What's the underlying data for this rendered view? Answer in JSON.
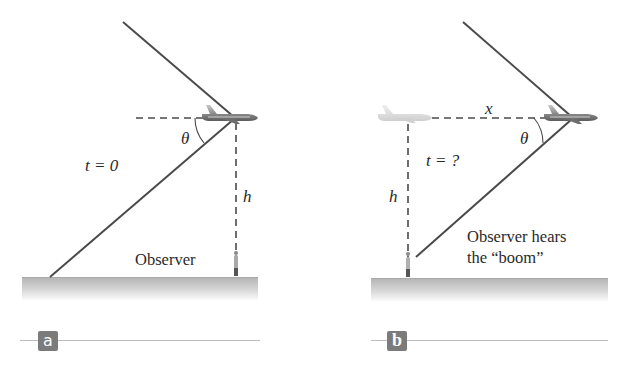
{
  "panels": [
    {
      "id": "a",
      "badge": "a",
      "time_label": "t = 0",
      "angle_label": "θ",
      "height_label": "h",
      "observer_label": "Observer"
    },
    {
      "id": "b",
      "badge": "b",
      "time_label": "t = ?",
      "angle_label": "θ",
      "height_label": "h",
      "distance_label": "x",
      "observer_label_line1": "Observer hears",
      "observer_label_line2": "the “boom”"
    }
  ],
  "colors": {
    "line": "#4a4a4a",
    "ground_top": "#b5b5b5",
    "ground_bottom": "#ffffff",
    "badge": "#7b7b7b",
    "rule": "#bdbdbd",
    "plane": "#8a8a8a",
    "ghost_plane": "#d6d6d6"
  }
}
